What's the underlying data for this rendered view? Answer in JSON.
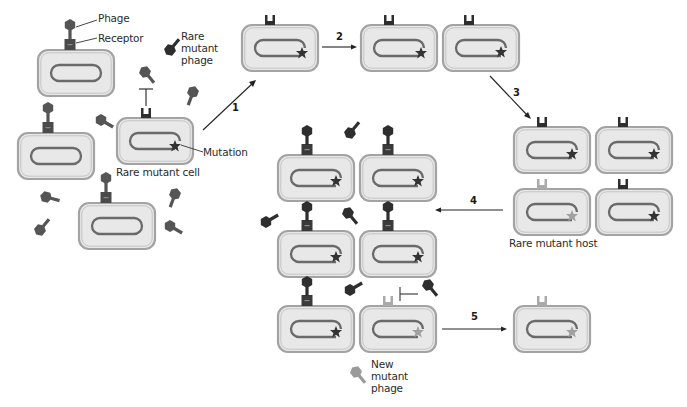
{
  "figure": {
    "type": "phage-host coevolution schematic",
    "colors": {
      "cell_fill": "#e6e6e6",
      "cell_wall": "#9a9a9a",
      "chromosome": "#6a6a6a",
      "phage_dark": "#3a3a3a",
      "phage_wild": "#5a5a5a",
      "receptor_dark": "#3a3a3a",
      "receptor_mutant": "#a8a8a8",
      "new_mutant_phage": "#9a9a9a",
      "star_dark": "#333333",
      "star_light": "#a0a0a0",
      "arrow": "#222222"
    }
  },
  "labels": {
    "phage": "Phage",
    "receptor": "Receptor",
    "rare_mutant_phage": [
      "Rare",
      "mutant",
      "phage"
    ],
    "mutation": "Mutation",
    "rare_mutant_cell": "Rare mutant cell",
    "rare_mutant_host": "Rare mutant host",
    "new_mutant_phage": [
      "New",
      "mutant",
      "phage"
    ]
  },
  "steps": {
    "s1": "1",
    "s2": "2",
    "s3": "3",
    "s4": "4",
    "s5": "5"
  }
}
